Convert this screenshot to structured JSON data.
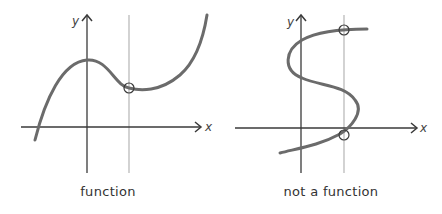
{
  "colors": {
    "axis": "#3a3a3a",
    "curve": "#6b6b6b",
    "vertical_line": "#b5b5b5",
    "marker": "#3a3a3a",
    "text": "#333333"
  },
  "panels": [
    {
      "id": "function",
      "caption": "function",
      "x_axis_label": "x",
      "y_axis_label": "y",
      "intersection_count": 1,
      "description": "Cubic-like curve crossed exactly once by the vertical line test"
    },
    {
      "id": "not-a-function",
      "caption": "not a function",
      "x_axis_label": "x",
      "y_axis_label": "y",
      "intersection_count": 2,
      "description": "S-shaped curve crossed twice by the vertical line test"
    }
  ]
}
